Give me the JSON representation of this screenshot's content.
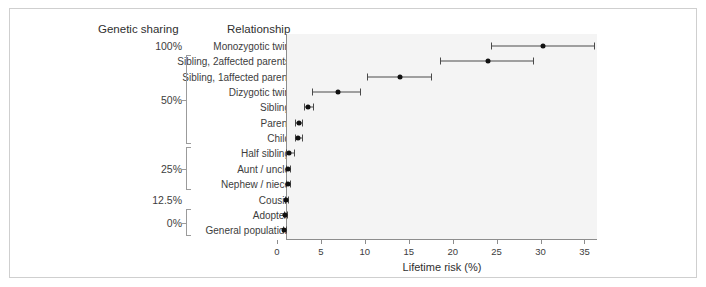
{
  "figure": {
    "col_header_genetic": "Genetic sharing",
    "col_header_relationship": "Relationship"
  },
  "chart_data": {
    "type": "scatter",
    "title": "",
    "xlabel": "Lifetime risk (%)",
    "ylabel": "",
    "xlim": [
      0,
      35.4
    ],
    "xticks": [
      0,
      5,
      10,
      15,
      20,
      25,
      30,
      35
    ],
    "xticklabels": [
      "0",
      "5",
      "10",
      "15",
      "20",
      "25",
      "30",
      "35"
    ],
    "grid": false,
    "legend": null,
    "orientation": "horizontal-error-bars",
    "categories": [
      "Monozygotic twin",
      "Sibling, 2affected parents",
      "Sibling, 1affected parent",
      "Dizygotic twin",
      "Sibling",
      "Parent",
      "Child",
      "Half sibling",
      "Aunt / uncle",
      "Nephew / niece",
      "Cousin",
      "Adoptee",
      "General population"
    ],
    "genetic_sharing": [
      "100%",
      "50%",
      "50%",
      "50%",
      "50%",
      "50%",
      "50%",
      "25%",
      "25%",
      "25%",
      "12.5%",
      "0%",
      "0%"
    ],
    "values": [
      30.3,
      24.0,
      14.0,
      6.9,
      3.5,
      2.5,
      2.4,
      1.4,
      1.2,
      1.2,
      1.0,
      0.9,
      0.8
    ],
    "ci_low": [
      24.4,
      18.6,
      10.2,
      4.0,
      3.1,
      2.1,
      2.0,
      1.0,
      1.0,
      1.0,
      0.9,
      0.8,
      0.7
    ],
    "ci_high": [
      36.1,
      29.1,
      17.5,
      9.4,
      4.1,
      2.9,
      2.8,
      1.9,
      1.5,
      1.5,
      1.2,
      1.1,
      1.0
    ]
  },
  "brackets": [
    {
      "label": "100%",
      "from": 0,
      "to": 0,
      "show_bracket": false
    },
    {
      "label": "50%",
      "from": 1,
      "to": 6,
      "show_bracket": true
    },
    {
      "label": "25%",
      "from": 7,
      "to": 9,
      "show_bracket": true
    },
    {
      "label": "12.5%",
      "from": 10,
      "to": 10,
      "show_bracket": false
    },
    {
      "label": "0%",
      "from": 11,
      "to": 12,
      "show_bracket": true
    }
  ]
}
